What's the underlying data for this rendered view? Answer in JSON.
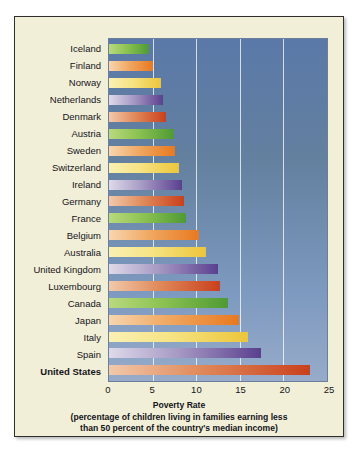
{
  "chart_data": {
    "type": "bar",
    "orientation": "horizontal",
    "title": "Poverty Rate",
    "subtitle_line1": "(percentage of children living in families earning less",
    "subtitle_line2": "than 50 percent of the country's median income)",
    "xlabel": "Poverty Rate",
    "ylabel": "",
    "xlim": [
      0,
      25
    ],
    "xticks": [
      "0",
      "5",
      "10",
      "15",
      "20",
      "25"
    ],
    "xtick_values": [
      0,
      5,
      10,
      15,
      20,
      25
    ],
    "grid": "vertical-white",
    "legend": "none",
    "categories": [
      "Iceland",
      "Finland",
      "Norway",
      "Netherlands",
      "Denmark",
      "Austria",
      "Sweden",
      "Switzerland",
      "Ireland",
      "Germany",
      "France",
      "Belgium",
      "Australia",
      "United Kingdom",
      "Luxembourg",
      "Canada",
      "Japan",
      "Italy",
      "Spain",
      "United States"
    ],
    "values": [
      4.6,
      5.1,
      6.0,
      6.2,
      6.5,
      7.4,
      7.6,
      8.0,
      8.4,
      8.6,
      8.8,
      10.3,
      11.1,
      12.5,
      12.7,
      13.6,
      14.9,
      15.9,
      17.4,
      23.0
    ],
    "highlighted_category": "United States",
    "bar_palette": [
      "#6fb43f",
      "#e8913d",
      "#edcd46",
      "#6a4e9e",
      "#cf4f22"
    ],
    "plot_background": "#6d88ae",
    "figure_background": "#f2efd8",
    "gridline_color": "#ffffff",
    "text_color": "#14141a"
  }
}
